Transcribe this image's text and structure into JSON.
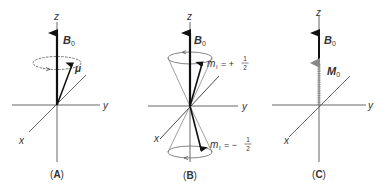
{
  "panels": [
    {
      "id": "A",
      "caption": "(A)",
      "caption_letter": "A",
      "axes": {
        "z": "z",
        "y": "y",
        "x": "x"
      },
      "field_label": "B",
      "field_sub": "0",
      "vector_label": "μ"
    },
    {
      "id": "B",
      "caption": "(B)",
      "caption_letter": "B",
      "axes": {
        "z": "z",
        "y": "y",
        "x": "x"
      },
      "field_label": "B",
      "field_sub": "0",
      "upper_state": {
        "symbol": "m",
        "sub": "I",
        "sign": "= +",
        "num": "1",
        "den": "2"
      },
      "lower_state": {
        "symbol": "m",
        "sub": "I",
        "sign": "= −",
        "num": "1",
        "den": "2"
      }
    },
    {
      "id": "C",
      "caption": "(C)",
      "caption_letter": "C",
      "axes": {
        "z": "z",
        "y": "y",
        "x": "x"
      },
      "field_label": "B",
      "field_sub": "0",
      "magnetization_label": "M",
      "magnetization_sub": "0"
    }
  ],
  "colors": {
    "axis": "#555555",
    "arrow": "#111111",
    "text": "#333333",
    "magnetization": "#888888"
  }
}
